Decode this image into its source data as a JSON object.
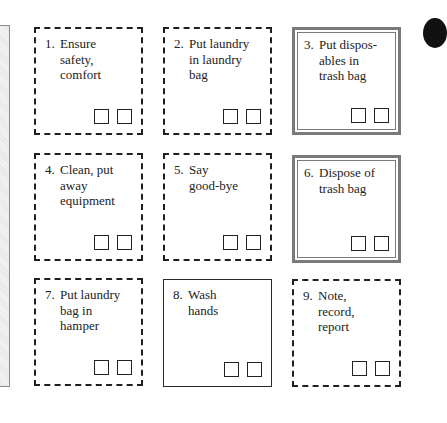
{
  "diagram": {
    "type": "procedure-checklist-grid",
    "steps": [
      {
        "number": "1.",
        "label": "Ensure\nsafety,\ncomfort",
        "border": "dashed"
      },
      {
        "number": "2.",
        "label": "Put laundry\nin laundry\nbag",
        "border": "dashed"
      },
      {
        "number": "3.",
        "label": "Put dispos-\nables in\ntrash bag",
        "border": "double"
      },
      {
        "number": "4.",
        "label": "Clean, put\naway\nequipment",
        "border": "dashed"
      },
      {
        "number": "5.",
        "label": "Say\ngood-bye",
        "border": "dashed"
      },
      {
        "number": "6.",
        "label": "Dispose of\ntrash bag",
        "border": "double"
      },
      {
        "number": "7.",
        "label": "Put laundry\nbag in\nhamper",
        "border": "dashed"
      },
      {
        "number": "8.",
        "label": "Wash\nhands",
        "border": "solid"
      },
      {
        "number": "9.",
        "label": "Note,\nrecord,\nreport",
        "border": "dashed"
      }
    ],
    "checkboxes_per_step": 2,
    "colors": {
      "dashed_border": "#1f1f1f",
      "double_border": "#7a7a7a",
      "side_panel": "#e6e6e6"
    }
  }
}
